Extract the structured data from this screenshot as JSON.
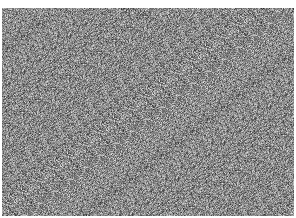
{
  "image": {
    "description": "Random grayscale noise",
    "width": 296,
    "height": 218,
    "border_color": "#ffffff",
    "noise": {
      "mean_gray": 138,
      "spread": 70
    }
  }
}
